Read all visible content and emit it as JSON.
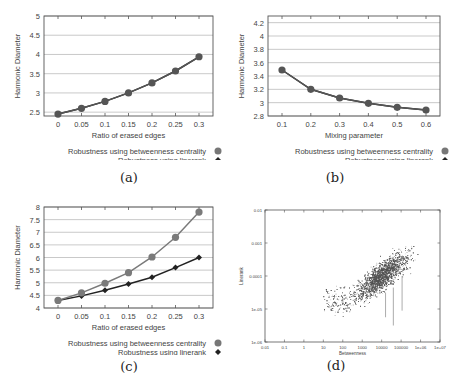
{
  "chart_data": [
    {
      "id": "a",
      "type": "line",
      "caption": "(a)",
      "xlabel": "Ratio of erased edges",
      "ylabel": "Harmonic Diameter",
      "x": [
        0,
        0.05,
        0.1,
        0.15,
        0.2,
        0.25,
        0.3
      ],
      "xticks": [
        "0",
        "0.05",
        "0.1",
        "0.15",
        "0.2",
        "0.25",
        "0.3"
      ],
      "yticks": [
        2.5,
        3,
        3.5,
        4,
        4.5,
        5
      ],
      "ylim": [
        2.4,
        5
      ],
      "grid": true,
      "legend_position": "below-right",
      "series": [
        {
          "name": "Robustness using betweenness centrality",
          "marker": "circle",
          "color": "#555555",
          "values": [
            2.45,
            2.6,
            2.78,
            3.0,
            3.26,
            3.57,
            3.94
          ]
        },
        {
          "name": "Robustness using linerank",
          "marker": "diamond",
          "color": "#222222",
          "values": [
            2.45,
            2.6,
            2.78,
            3.0,
            3.26,
            3.57,
            3.94
          ]
        }
      ]
    },
    {
      "id": "b",
      "type": "line",
      "caption": "(b)",
      "xlabel": "Mixing parameter",
      "ylabel": "Harmonic Diameter",
      "x": [
        0.1,
        0.2,
        0.3,
        0.4,
        0.5,
        0.6
      ],
      "xticks": [
        "0.1",
        "0.2",
        "0.3",
        "0.4",
        "0.5",
        "0.6"
      ],
      "yticks": [
        2.8,
        3,
        3.2,
        3.4,
        3.6,
        3.8,
        4,
        4.2
      ],
      "ylim": [
        2.8,
        4.3
      ],
      "grid": true,
      "legend_position": "below-right",
      "series": [
        {
          "name": "Robustness using betweenness centrality",
          "marker": "circle",
          "color": "#555555",
          "values": [
            3.49,
            3.2,
            3.07,
            2.99,
            2.93,
            2.89
          ]
        },
        {
          "name": "Robustness using linerank",
          "marker": "diamond",
          "color": "#222222",
          "values": [
            3.49,
            3.2,
            3.07,
            2.99,
            2.93,
            2.89
          ]
        }
      ]
    },
    {
      "id": "c",
      "type": "line",
      "caption": "(c)",
      "xlabel": "Ratio of erased edges",
      "ylabel": "Harmonic Diameter",
      "x": [
        0,
        0.05,
        0.1,
        0.15,
        0.2,
        0.25,
        0.3
      ],
      "xticks": [
        "0",
        "0.05",
        "0.1",
        "0.15",
        "0.2",
        "0.25",
        "0.3"
      ],
      "yticks": [
        4,
        4.5,
        5,
        5.5,
        6,
        6.5,
        7,
        7.5,
        8
      ],
      "ylim": [
        4,
        8
      ],
      "grid": true,
      "legend_position": "below-right",
      "series": [
        {
          "name": "Robustness using betweenness centrality",
          "marker": "circle",
          "color": "#7a7a7a",
          "values": [
            4.3,
            4.6,
            4.98,
            5.4,
            6.02,
            6.8,
            7.8
          ]
        },
        {
          "name": "Robustness using linerank",
          "marker": "diamond",
          "color": "#222222",
          "values": [
            4.3,
            4.48,
            4.7,
            4.95,
            5.22,
            5.6,
            6.0
          ]
        }
      ]
    },
    {
      "id": "d",
      "type": "scatter",
      "caption": "(d)",
      "xlabel": "Betweenness",
      "ylabel": "Linerank",
      "xscale": "log",
      "yscale": "log",
      "xticks": [
        "0.01",
        "0.1",
        "1",
        "10",
        "100",
        "1000",
        "10000",
        "100000",
        "1e+06",
        "1e+07"
      ],
      "yticks": [
        "1e-06",
        "1e-05",
        "0.0001",
        "0.001",
        "0.01"
      ],
      "xlim": [
        0.01,
        10000000
      ],
      "ylim": [
        1e-06,
        0.01
      ],
      "grid": false,
      "description": "Dense cloud of points, correlation increasing toward upper right; bulk between betweenness 100-1e+06 and linerank 1e-05-0.001"
    }
  ],
  "legend": {
    "bc_label": "Robustness using betweenness centrality",
    "lr_label": "Robustness using linerank"
  },
  "colors": {
    "grid": "#bbbbbb",
    "axis": "#555555",
    "scatter_point": "#555555"
  }
}
